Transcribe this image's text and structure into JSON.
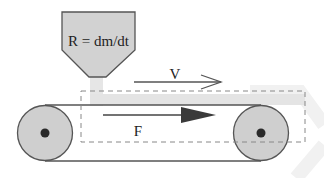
{
  "diagram": {
    "hopper": {
      "label": "R = dm/dt"
    },
    "velocity_arrow": {
      "label": "V"
    },
    "force_arrow": {
      "label": "F"
    }
  },
  "colors": {
    "background": "#ffffff",
    "hopper_fill": "#d2d2d2",
    "outline": "#555555",
    "pulley_fill": "#cfcfcf",
    "pulley_hub": "#2a2a2a",
    "sand": "#e4e4e4",
    "dashed_box": "#888888",
    "arrow": "#444444",
    "watermark": "#f2f2f2"
  }
}
